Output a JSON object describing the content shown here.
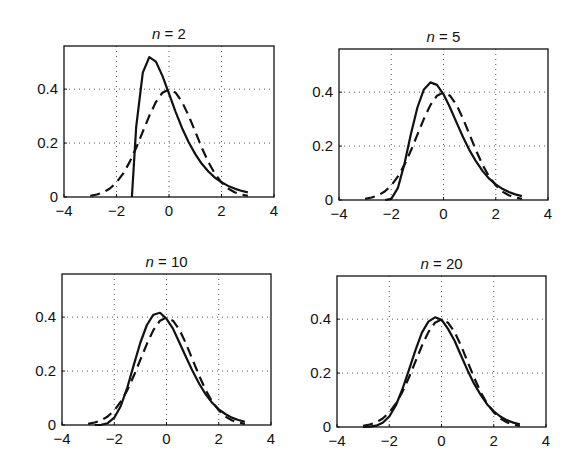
{
  "figure": {
    "width": 582,
    "height": 470,
    "background": "#ffffff",
    "ink": "#111111",
    "grid_color": "#555555"
  },
  "chart_data": [
    {
      "type": "line",
      "title": "n = 2",
      "title_var": "n",
      "title_value": "2",
      "box": {
        "left": 64,
        "top": 46,
        "right": 274,
        "bottom": 197
      },
      "xlim": [
        -4,
        4
      ],
      "ylim": [
        0,
        0.56
      ],
      "xticks": [
        -4,
        -2,
        0,
        2,
        4
      ],
      "xtick_labels": [
        "−4",
        "−2",
        "0",
        "2",
        "4"
      ],
      "yticks": [
        0,
        0.2,
        0.4
      ],
      "ytick_labels": [
        "0",
        "0.2",
        "0.4"
      ],
      "grid": true,
      "xlabel": "",
      "ylabel": "",
      "series": [
        {
          "name": "standardized sum (n=2)",
          "style": "solid",
          "x": [
            -1.414,
            -1.414,
            -1.25,
            -1,
            -0.75,
            -0.5,
            -0.25,
            0,
            0.25,
            0.5,
            0.75,
            1,
            1.25,
            1.5,
            1.75,
            2,
            2.25,
            2.5,
            2.75,
            3
          ],
          "y": [
            0,
            0.0,
            0.26,
            0.461,
            0.519,
            0.502,
            0.449,
            0.383,
            0.316,
            0.255,
            0.203,
            0.159,
            0.123,
            0.0945,
            0.072,
            0.0546,
            0.041,
            0.031,
            0.023,
            0.017
          ]
        },
        {
          "name": "standard normal",
          "style": "dashed",
          "x": [
            -3,
            -2.75,
            -2.5,
            -2.25,
            -2,
            -1.75,
            -1.5,
            -1.25,
            -1,
            -0.75,
            -0.5,
            -0.25,
            0,
            0.25,
            0.5,
            0.75,
            1,
            1.25,
            1.5,
            1.75,
            2,
            2.25,
            2.5,
            2.75,
            3
          ],
          "y": [
            0.0044,
            0.0091,
            0.0175,
            0.0317,
            0.054,
            0.0863,
            0.1295,
            0.1826,
            0.242,
            0.3011,
            0.3521,
            0.3867,
            0.3989,
            0.3867,
            0.3521,
            0.3011,
            0.242,
            0.1826,
            0.1295,
            0.0863,
            0.054,
            0.0317,
            0.0175,
            0.0091,
            0.0044
          ]
        }
      ]
    },
    {
      "type": "line",
      "title": "n = 5",
      "title_var": "n",
      "title_value": "5",
      "box": {
        "left": 339,
        "top": 49,
        "right": 548,
        "bottom": 200
      },
      "xlim": [
        -4,
        4
      ],
      "ylim": [
        0,
        0.56
      ],
      "xticks": [
        -4,
        -2,
        0,
        2,
        4
      ],
      "xtick_labels": [
        "−4",
        "−2",
        "0",
        "2",
        "4"
      ],
      "yticks": [
        0,
        0.2,
        0.4
      ],
      "ytick_labels": [
        "0",
        "0.2",
        "0.4"
      ],
      "grid": true,
      "xlabel": "",
      "ylabel": "",
      "series": [
        {
          "name": "standardized sum (n=5)",
          "style": "solid",
          "x": [
            -2.236,
            -2,
            -1.75,
            -1.5,
            -1.25,
            -1,
            -0.75,
            -0.5,
            -0.25,
            0,
            0.25,
            0.5,
            0.75,
            1,
            1.25,
            1.5,
            1.75,
            2,
            2.25,
            2.5,
            2.75,
            3
          ],
          "y": [
            0,
            0.0043,
            0.0438,
            0.132,
            0.243,
            0.343,
            0.41,
            0.436,
            0.427,
            0.392,
            0.343,
            0.287,
            0.233,
            0.184,
            0.142,
            0.107,
            0.079,
            0.058,
            0.0415,
            0.0295,
            0.0207,
            0.0144
          ]
        },
        {
          "name": "standard normal",
          "style": "dashed",
          "x": [
            -3,
            -2.75,
            -2.5,
            -2.25,
            -2,
            -1.75,
            -1.5,
            -1.25,
            -1,
            -0.75,
            -0.5,
            -0.25,
            0,
            0.25,
            0.5,
            0.75,
            1,
            1.25,
            1.5,
            1.75,
            2,
            2.25,
            2.5,
            2.75,
            3
          ],
          "y": [
            0.0044,
            0.0091,
            0.0175,
            0.0317,
            0.054,
            0.0863,
            0.1295,
            0.1826,
            0.242,
            0.3011,
            0.3521,
            0.3867,
            0.3989,
            0.3867,
            0.3521,
            0.3011,
            0.242,
            0.1826,
            0.1295,
            0.0863,
            0.054,
            0.0317,
            0.0175,
            0.0091,
            0.0044
          ]
        }
      ]
    },
    {
      "type": "line",
      "title": "n = 10",
      "title_var": "n",
      "title_value": "10",
      "box": {
        "left": 62,
        "top": 274,
        "right": 271,
        "bottom": 425
      },
      "xlim": [
        -4,
        4
      ],
      "ylim": [
        0,
        0.56
      ],
      "xticks": [
        -4,
        -2,
        0,
        2,
        4
      ],
      "xtick_labels": [
        "−4",
        "−2",
        "0",
        "2",
        "4"
      ],
      "yticks": [
        0,
        0.2,
        0.4
      ],
      "ytick_labels": [
        "0",
        "0.2",
        "0.4"
      ],
      "grid": true,
      "xlabel": "",
      "ylabel": "",
      "series": [
        {
          "name": "standardized sum (n=10)",
          "style": "solid",
          "x": [
            -2.75,
            -2.5,
            -2.25,
            -2,
            -1.75,
            -1.5,
            -1.25,
            -1,
            -0.75,
            -0.5,
            -0.25,
            0,
            0.25,
            0.5,
            0.75,
            1,
            1.25,
            1.5,
            1.75,
            2,
            2.25,
            2.5,
            2.75,
            3
          ],
          "y": [
            0.0,
            0.0008,
            0.0067,
            0.027,
            0.0706,
            0.139,
            0.223,
            0.306,
            0.371,
            0.409,
            0.416,
            0.394,
            0.357,
            0.304,
            0.251,
            0.2,
            0.153,
            0.114,
            0.0825,
            0.0584,
            0.0408,
            0.0276,
            0.0185,
            0.0122
          ]
        },
        {
          "name": "standard normal",
          "style": "dashed",
          "x": [
            -3,
            -2.75,
            -2.5,
            -2.25,
            -2,
            -1.75,
            -1.5,
            -1.25,
            -1,
            -0.75,
            -0.5,
            -0.25,
            0,
            0.25,
            0.5,
            0.75,
            1,
            1.25,
            1.5,
            1.75,
            2,
            2.25,
            2.5,
            2.75,
            3
          ],
          "y": [
            0.0044,
            0.0091,
            0.0175,
            0.0317,
            0.054,
            0.0863,
            0.1295,
            0.1826,
            0.242,
            0.3011,
            0.3521,
            0.3867,
            0.3989,
            0.3867,
            0.3521,
            0.3011,
            0.242,
            0.1826,
            0.1295,
            0.0863,
            0.054,
            0.0317,
            0.0175,
            0.0091,
            0.0044
          ]
        }
      ]
    },
    {
      "type": "line",
      "title": "n = 20",
      "title_var": "n",
      "title_value": "20",
      "box": {
        "left": 337,
        "top": 276,
        "right": 546,
        "bottom": 427
      },
      "xlim": [
        -4,
        4
      ],
      "ylim": [
        0,
        0.56
      ],
      "xticks": [
        -4,
        -2,
        0,
        2,
        4
      ],
      "xtick_labels": [
        "−4",
        "−2",
        "0",
        "2",
        "4"
      ],
      "yticks": [
        0,
        0.2,
        0.4
      ],
      "ytick_labels": [
        "0",
        "0.2",
        "0.4"
      ],
      "grid": true,
      "xlabel": "",
      "ylabel": "",
      "series": [
        {
          "name": "standardized sum (n=20)",
          "style": "solid",
          "x": [
            -3,
            -2.75,
            -2.5,
            -2.25,
            -2,
            -1.75,
            -1.5,
            -1.25,
            -1,
            -0.75,
            -0.5,
            -0.25,
            0,
            0.25,
            0.5,
            0.75,
            1,
            1.25,
            1.5,
            1.75,
            2,
            2.25,
            2.5,
            2.75,
            3
          ],
          "y": [
            0.0002,
            0.0012,
            0.005,
            0.0157,
            0.039,
            0.0796,
            0.139,
            0.21,
            0.284,
            0.35,
            0.391,
            0.407,
            0.398,
            0.364,
            0.32,
            0.264,
            0.21,
            0.16,
            0.119,
            0.0837,
            0.0584,
            0.039,
            0.0257,
            0.0164,
            0.0102
          ]
        },
        {
          "name": "standard normal",
          "style": "dashed",
          "x": [
            -3,
            -2.75,
            -2.5,
            -2.25,
            -2,
            -1.75,
            -1.5,
            -1.25,
            -1,
            -0.75,
            -0.5,
            -0.25,
            0,
            0.25,
            0.5,
            0.75,
            1,
            1.25,
            1.5,
            1.75,
            2,
            2.25,
            2.5,
            2.75,
            3
          ],
          "y": [
            0.0044,
            0.0091,
            0.0175,
            0.0317,
            0.054,
            0.0863,
            0.1295,
            0.1826,
            0.242,
            0.3011,
            0.3521,
            0.3867,
            0.3989,
            0.3867,
            0.3521,
            0.3011,
            0.242,
            0.1826,
            0.1295,
            0.0863,
            0.054,
            0.0317,
            0.0175,
            0.0091,
            0.0044
          ]
        }
      ]
    }
  ]
}
